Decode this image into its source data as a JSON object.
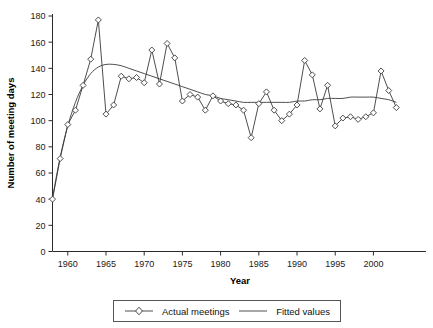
{
  "chart_data": {
    "type": "line",
    "title": "",
    "xlabel": "Year",
    "ylabel": "Number of meeting days",
    "xlim": [
      1958,
      2004
    ],
    "ylim": [
      0,
      180
    ],
    "xticks": [
      1960,
      1965,
      1970,
      1975,
      1980,
      1985,
      1990,
      1995,
      2000
    ],
    "yticks": [
      0,
      20,
      40,
      60,
      80,
      100,
      120,
      140,
      160,
      180
    ],
    "grid": false,
    "legend_position": "bottom",
    "x": [
      1958,
      1959,
      1960,
      1961,
      1962,
      1963,
      1964,
      1965,
      1966,
      1967,
      1968,
      1969,
      1970,
      1971,
      1972,
      1973,
      1974,
      1975,
      1976,
      1977,
      1978,
      1979,
      1980,
      1981,
      1982,
      1983,
      1984,
      1985,
      1986,
      1987,
      1988,
      1989,
      1990,
      1991,
      1992,
      1993,
      1994,
      1995,
      1996,
      1997,
      1998,
      1999,
      2000,
      2001,
      2002,
      2003
    ],
    "series": [
      {
        "name": "Actual meetings",
        "marker": "diamond",
        "values": [
          40,
          71,
          97,
          108,
          127,
          147,
          177,
          105,
          112,
          134,
          132,
          133,
          129,
          154,
          128,
          159,
          148,
          115,
          120,
          118,
          108,
          119,
          115,
          113,
          112,
          108,
          87,
          113,
          122,
          108,
          100,
          105,
          112,
          146,
          135,
          109,
          127,
          96,
          102,
          103,
          101,
          103,
          106,
          138,
          123,
          110
        ]
      },
      {
        "name": "Fitted values",
        "marker": "none",
        "values": [
          41,
          72,
          96,
          114,
          127,
          136,
          141,
          143,
          143,
          142,
          140,
          138,
          136,
          134,
          132,
          130,
          128,
          126,
          124,
          122,
          120,
          119,
          117,
          116,
          115,
          114,
          114,
          114,
          114,
          114,
          114,
          114,
          115,
          115,
          116,
          116,
          117,
          117,
          117,
          118,
          118,
          118,
          118,
          117,
          116,
          114
        ]
      }
    ]
  },
  "legend": {
    "items": [
      {
        "label": "Actual meetings",
        "symbol": "line-with-diamond-marker"
      },
      {
        "label": "Fitted values",
        "symbol": "plain-line"
      }
    ]
  },
  "colors": {
    "line": "#3a3a3a",
    "axis": "#2b2b2b",
    "marker_fill": "#ffffff",
    "background": "#ffffff",
    "text": "#111111"
  }
}
